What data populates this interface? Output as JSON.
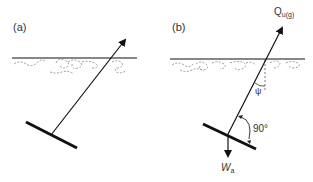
{
  "panels": [
    {
      "id": "a",
      "label": "(a)"
    },
    {
      "id": "b",
      "label": "(b)",
      "force_up": {
        "symbol": "Q",
        "subscript": "u(g)"
      },
      "force_down": {
        "symbol": "W",
        "subscript": "a"
      },
      "angle_label": "90°",
      "inclination_symbol": "ψ"
    }
  ],
  "colors": {
    "ink": "#111111",
    "dashed": "#666666",
    "text": "#333333"
  }
}
